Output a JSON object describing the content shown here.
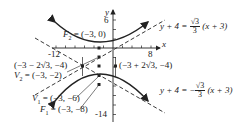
{
  "diagram": {
    "type": "hyperbola-graph",
    "axes": {
      "x_label": "x",
      "y_label": "y",
      "x_ticks": {
        "left_label": "-12",
        "right_label": "8"
      },
      "y_ticks": {
        "top_label": "6",
        "bottom_label": "-14"
      }
    },
    "points": {
      "F2": {
        "name": "F",
        "sub": "2",
        "coords": " = (−3, 0)"
      },
      "V2": {
        "name": "V",
        "sub": "2",
        "coords": " = (−3, −2)"
      },
      "V1": {
        "name": "V",
        "sub": "1",
        "coords": " = (−3, −6)"
      },
      "F1": {
        "name": "F",
        "sub": "1",
        "coords": " = (−3, −8)"
      },
      "left_box": "(−3 − 2√3, −4)",
      "right_box": "(−3 + 2√3, −4)"
    },
    "asymptotes": {
      "upper": {
        "lhs": "y + 4 = ",
        "sign": "",
        "num": "√3",
        "den": "3",
        "rhs": " (x + 3)"
      },
      "lower": {
        "lhs": "y + 4 = ",
        "sign": "−",
        "num": "√3",
        "den": "3",
        "rhs": " (x + 3)"
      }
    },
    "colors": {
      "ink": "#222222",
      "background": "#ffffff"
    }
  }
}
